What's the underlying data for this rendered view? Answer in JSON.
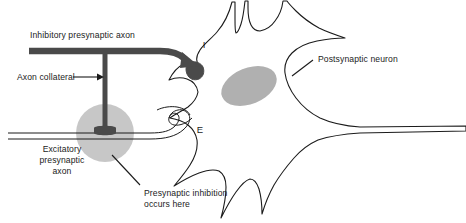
{
  "figure": {
    "background_color": "#ffffff",
    "ink_color": "#1b1b1b",
    "axon_color": "#4a4a4a",
    "shade_color": "#b3b3b3",
    "nucleus_color": "#b0b0b0"
  },
  "labels": {
    "inhibitory_axon": "Inhibitory presynaptic axon",
    "axon_collateral": "Axon collateral",
    "excitatory_axon_line1": "Excitatory",
    "excitatory_axon_line2": "presynaptic",
    "excitatory_axon_line3": "axon",
    "presynaptic_inhibition_line1": "Presynaptic inhibition",
    "presynaptic_inhibition_line2": "occurs here",
    "postsynaptic_neuron": "Postsynaptic neuron",
    "inhibitory_synapse_marker": "I",
    "excitatory_synapse_marker": "E"
  },
  "annotations": {
    "callout_count": 3,
    "synapse_markers": [
      "I",
      "E"
    ]
  }
}
